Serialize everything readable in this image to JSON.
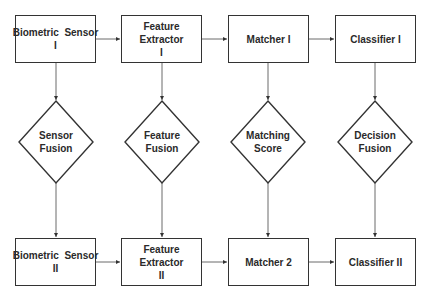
{
  "diagram": {
    "top_row": [
      {
        "line1": "Biometric  Sensor",
        "line2": "I"
      },
      {
        "line1": "Feature Extractor",
        "line2": "I"
      },
      {
        "line1": "Matcher I",
        "line2": ""
      },
      {
        "line1": "Classifier I",
        "line2": ""
      }
    ],
    "fusion_row": [
      {
        "line1": "Sensor",
        "line2": "Fusion"
      },
      {
        "line1": "Feature",
        "line2": "Fusion"
      },
      {
        "line1": "Matching",
        "line2": "Score"
      },
      {
        "line1": "Decision",
        "line2": "Fusion"
      }
    ],
    "bottom_row": [
      {
        "line1": "Biometric  Sensor",
        "line2": "II"
      },
      {
        "line1": "Feature Extractor",
        "line2": "II"
      },
      {
        "line1": "Matcher 2",
        "line2": ""
      },
      {
        "line1": "Classifier II",
        "line2": ""
      }
    ],
    "colors": {
      "stroke": "#333333",
      "text": "#2a2a2a",
      "background": "#ffffff"
    }
  }
}
